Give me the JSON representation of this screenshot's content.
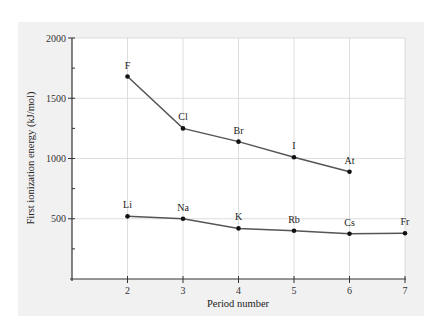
{
  "chart_data": {
    "type": "line",
    "title": "",
    "xlabel": "Period number",
    "ylabel": "First ionization energy (kJ/mol)",
    "x_ticks": [
      2,
      3,
      4,
      5,
      6,
      7
    ],
    "y_ticks": [
      500,
      1000,
      1500,
      2000
    ],
    "xlim": [
      1,
      7
    ],
    "ylim": [
      0,
      2000
    ],
    "grid": true,
    "legend": null,
    "series": [
      {
        "name": "Halogens",
        "x": [
          2,
          3,
          4,
          5,
          6
        ],
        "values": [
          1680,
          1250,
          1140,
          1010,
          890
        ],
        "labels": [
          "F",
          "Cl",
          "Br",
          "I",
          "At"
        ]
      },
      {
        "name": "Alkali metals",
        "x": [
          2,
          3,
          4,
          5,
          6,
          7
        ],
        "values": [
          520,
          500,
          420,
          400,
          375,
          380
        ],
        "labels": [
          "Li",
          "Na",
          "K",
          "Rb",
          "Cs",
          "Fr"
        ]
      }
    ]
  },
  "colors": {
    "panel_bg": "#f1f1f1",
    "plot_bg": "#ffffff",
    "line": "#555555",
    "marker": "#111111",
    "grid": "#d6d6d6",
    "axis": "#333333"
  }
}
